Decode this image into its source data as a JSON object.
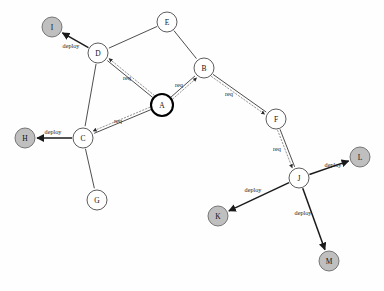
{
  "diagram": {
    "type": "directed-graph",
    "title": "",
    "canvas": {
      "width": 384,
      "height": 291,
      "background": "#fefefe"
    },
    "colors": {
      "node_fill": "#ffffff",
      "terminal_node_fill": "#bfbfbf",
      "node_stroke": "#4a4a4a",
      "active_node_stroke": "#000000",
      "edge_stroke": "#3a3a3a",
      "dotted_edge_stroke": "#8a8a8a",
      "label_color": "#1a1a1a"
    },
    "nodes": [
      {
        "id": "I",
        "label": "I",
        "x": 52,
        "y": 27,
        "r": 10,
        "style": "terminal"
      },
      {
        "id": "E",
        "label": "E",
        "x": 167,
        "y": 22,
        "r": 10,
        "style": "plain"
      },
      {
        "id": "D",
        "label": "D",
        "x": 98,
        "y": 53,
        "r": 10,
        "style": "plain"
      },
      {
        "id": "B",
        "label": "B",
        "x": 204,
        "y": 68,
        "r": 10,
        "style": "plain"
      },
      {
        "id": "A",
        "label": "A",
        "x": 162,
        "y": 105,
        "r": 11,
        "style": "active"
      },
      {
        "id": "F",
        "label": "F",
        "x": 276,
        "y": 119,
        "r": 10,
        "style": "plain"
      },
      {
        "id": "H",
        "label": "H",
        "x": 25,
        "y": 138,
        "r": 10,
        "style": "terminal"
      },
      {
        "id": "C",
        "label": "C",
        "x": 83,
        "y": 138,
        "r": 10,
        "style": "plain"
      },
      {
        "id": "L",
        "label": "L",
        "x": 360,
        "y": 157,
        "r": 10,
        "style": "terminal"
      },
      {
        "id": "J",
        "label": "J",
        "x": 299,
        "y": 178,
        "r": 10,
        "style": "plain"
      },
      {
        "id": "G",
        "label": "G",
        "x": 97,
        "y": 200,
        "r": 10,
        "style": "plain"
      },
      {
        "id": "K",
        "label": "K",
        "x": 218,
        "y": 216,
        "r": 10,
        "style": "terminal"
      },
      {
        "id": "M",
        "label": "M",
        "x": 329,
        "y": 261,
        "r": 10,
        "style": "terminal"
      }
    ],
    "edges": [
      {
        "id": "D-I",
        "from": "D",
        "to": "I",
        "label": "deploy",
        "kind": "deploy",
        "arrow": true,
        "dotted": false,
        "label_x": 71,
        "label_y": 45
      },
      {
        "id": "E-D",
        "from": "E",
        "to": "D",
        "label": "",
        "kind": "plain",
        "arrow": false,
        "dotted": false,
        "label_x": 0,
        "label_y": 0
      },
      {
        "id": "E-B",
        "from": "E",
        "to": "B",
        "label": "",
        "kind": "plain",
        "arrow": false,
        "dotted": false,
        "label_x": 0,
        "label_y": 0
      },
      {
        "id": "D-C",
        "from": "D",
        "to": "C",
        "label": "",
        "kind": "plain",
        "arrow": false,
        "dotted": false,
        "label_x": 0,
        "label_y": 0
      },
      {
        "id": "C-G",
        "from": "C",
        "to": "G",
        "label": "",
        "kind": "plain",
        "arrow": false,
        "dotted": false,
        "label_x": 0,
        "label_y": 0
      },
      {
        "id": "C-H",
        "from": "C",
        "to": "H",
        "label": "deploy",
        "kind": "deploy",
        "arrow": true,
        "dotted": false,
        "label_x": 53,
        "label_y": 131
      },
      {
        "id": "A-D",
        "from": "A",
        "to": "D",
        "label": "req",
        "kind": "req",
        "arrow": true,
        "dotted": true,
        "label_x": 127,
        "label_y": 77
      },
      {
        "id": "A-C",
        "from": "A",
        "to": "C",
        "label": "req",
        "kind": "req",
        "arrow": true,
        "dotted": true,
        "label_x": 118,
        "label_y": 120
      },
      {
        "id": "A-B",
        "from": "A",
        "to": "B",
        "label": "req",
        "kind": "req",
        "arrow": true,
        "dotted": true,
        "label_x": 179,
        "label_y": 84
      },
      {
        "id": "B-F",
        "from": "B",
        "to": "F",
        "label": "req",
        "kind": "req",
        "arrow": true,
        "dotted": true,
        "label_x": 229,
        "label_y": 93
      },
      {
        "id": "F-J",
        "from": "F",
        "to": "J",
        "label": "req",
        "kind": "req",
        "arrow": true,
        "dotted": true,
        "label_x": 277,
        "label_y": 148
      },
      {
        "id": "J-L",
        "from": "J",
        "to": "L",
        "label": "deploy",
        "kind": "deploy",
        "arrow": true,
        "dotted": false,
        "label_x": 333,
        "label_y": 164
      },
      {
        "id": "J-K",
        "from": "J",
        "to": "K",
        "label": "deploy",
        "kind": "deploy",
        "arrow": true,
        "dotted": false,
        "label_x": 253,
        "label_y": 189
      },
      {
        "id": "J-M",
        "from": "J",
        "to": "M",
        "label": "deploy",
        "kind": "deploy",
        "arrow": true,
        "dotted": false,
        "label_x": 303,
        "label_y": 212
      }
    ]
  }
}
